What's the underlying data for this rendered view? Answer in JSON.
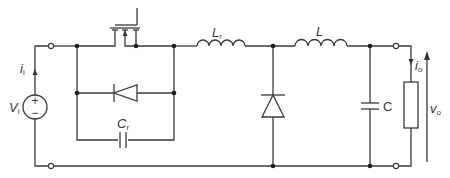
{
  "diagram": {
    "type": "circuit-schematic",
    "colors": {
      "wire": "#3a3a3a",
      "node": "#1e1e1e",
      "text": "#333333",
      "background": "#ffffff"
    },
    "labels": {
      "source_voltage": {
        "main": "V",
        "sub": "i"
      },
      "input_current": {
        "main": "i",
        "sub": "i"
      },
      "resonant_capacitor": {
        "main": "C",
        "sub": "r"
      },
      "resonant_inductor": {
        "main": "L",
        "sub": "r"
      },
      "filter_inductor": {
        "main": "L",
        "sub": ""
      },
      "filter_capacitor": {
        "main": "C"
      },
      "output_current": {
        "main": "i",
        "sub": "o"
      },
      "output_voltage": {
        "main": "v",
        "sub": "o"
      },
      "source_plus": "+",
      "source_minus": "−"
    },
    "components": [
      {
        "id": "Vi",
        "kind": "voltage-source"
      },
      {
        "id": "S",
        "kind": "mosfet-switch"
      },
      {
        "id": "D1",
        "kind": "antiparallel-diode"
      },
      {
        "id": "Cr",
        "kind": "capacitor"
      },
      {
        "id": "Lr",
        "kind": "inductor"
      },
      {
        "id": "D2",
        "kind": "freewheeling-diode"
      },
      {
        "id": "L",
        "kind": "inductor"
      },
      {
        "id": "C",
        "kind": "capacitor"
      },
      {
        "id": "R",
        "kind": "load-resistor"
      }
    ]
  }
}
